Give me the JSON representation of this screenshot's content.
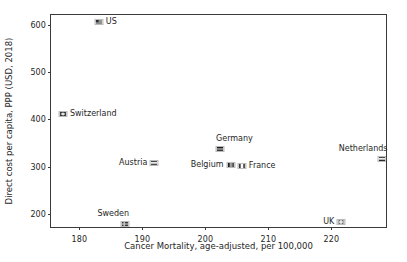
{
  "chart_data": {
    "type": "scatter",
    "title": "",
    "xlabel": "Cancer Mortality, age-adjusted, per 100,000",
    "ylabel": "Direct cost per capita, PPP (USD, 2018)",
    "xlim": [
      175.5,
      229.0
    ],
    "ylim": [
      168.0,
      621.0
    ],
    "xticks": [
      180,
      190,
      200,
      210,
      220
    ],
    "xticklabels": [
      "180",
      "190",
      "200",
      "210",
      "220"
    ],
    "yticks": [
      200,
      300,
      400,
      500,
      600
    ],
    "yticklabels": [
      "200",
      "300",
      "400",
      "500",
      "600"
    ],
    "grid": false,
    "legend": "none",
    "marker_style": "country-flag",
    "points": [
      {
        "name": "US",
        "label": "US",
        "x": 183.1,
        "y": 607,
        "label_position": "right",
        "flag": "us"
      },
      {
        "name": "Switzerland",
        "label": "Switzerland",
        "x": 177.4,
        "y": 411,
        "label_position": "right",
        "flag": "ch"
      },
      {
        "name": "Germany",
        "label": "Germany",
        "x": 202.4,
        "y": 337,
        "label_position": "above-right",
        "flag": "de"
      },
      {
        "name": "Netherlands",
        "label": "Netherlands",
        "x": 228.0,
        "y": 316,
        "label_position": "above-left",
        "flag": "nl"
      },
      {
        "name": "Austria",
        "label": "Austria",
        "x": 191.9,
        "y": 307,
        "label_position": "left",
        "flag": "at"
      },
      {
        "name": "Belgium",
        "label": "Belgium",
        "x": 204.0,
        "y": 303,
        "label_position": "left",
        "flag": "be"
      },
      {
        "name": "France",
        "label": "France",
        "x": 205.8,
        "y": 301,
        "label_position": "right",
        "flag": "fr"
      },
      {
        "name": "Sweden",
        "label": "Sweden",
        "x": 187.3,
        "y": 178,
        "label_position": "above-left",
        "flag": "se"
      },
      {
        "name": "UK",
        "label": "UK",
        "x": 221.6,
        "y": 182,
        "label_position": "left",
        "flag": "gb"
      }
    ]
  },
  "colors": {
    "axis": "#3a3a3a",
    "text": "#262626",
    "background": "#ffffff"
  }
}
